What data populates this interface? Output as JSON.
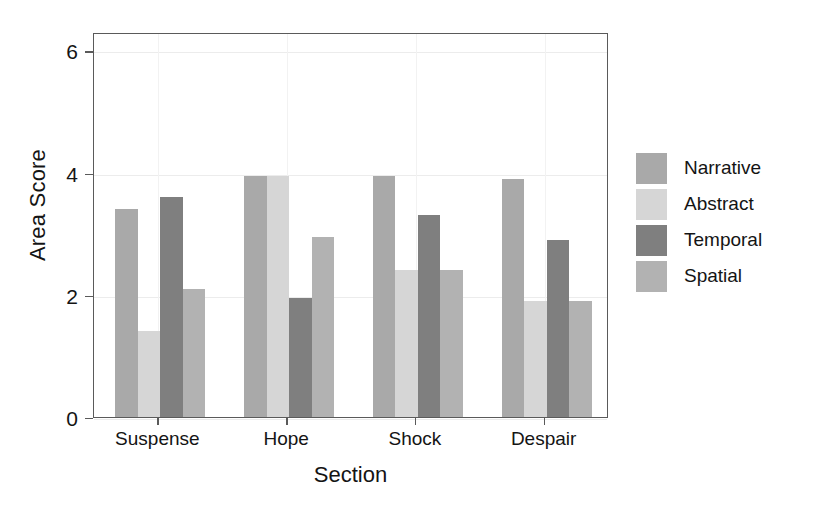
{
  "chart_data": {
    "type": "bar",
    "title": "",
    "xlabel": "Section",
    "ylabel": "Area Score",
    "categories": [
      "Suspense",
      "Hope",
      "Shock",
      "Despair"
    ],
    "series": [
      {
        "name": "Narrative",
        "color": "#a9a9a9",
        "values": [
          3.4,
          3.95,
          3.95,
          3.9
        ]
      },
      {
        "name": "Abstract",
        "color": "#d6d6d6",
        "values": [
          1.4,
          3.95,
          2.4,
          1.9
        ]
      },
      {
        "name": "Temporal",
        "color": "#7f7f7f",
        "values": [
          3.6,
          1.95,
          3.3,
          2.9
        ]
      },
      {
        "name": "Spatial",
        "color": "#b2b2b2",
        "values": [
          2.1,
          2.95,
          2.4,
          1.9
        ]
      }
    ],
    "ylim": [
      0,
      6.3
    ],
    "yticks": [
      0,
      2,
      4,
      6
    ],
    "ytick_labels": [
      "0",
      "2",
      "4",
      "6"
    ],
    "grid": true,
    "grid_axis": "both",
    "legend_position": "right",
    "legend_entries": [
      "Narrative",
      "Abstract",
      "Temporal",
      "Spatial"
    ],
    "bar_group_count": 4,
    "bars_per_group": 4
  },
  "axes": {
    "y_axis_title": "Area Score",
    "x_axis_title": "Section"
  }
}
